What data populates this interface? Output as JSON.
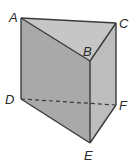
{
  "diagram": {
    "type": "triangular-prism",
    "colors": {
      "front_face": "#a9a9a9",
      "right_face": "#b9b9b9",
      "top_face": "#c4c4c4",
      "edge": "#3a3a3a",
      "hidden_edge": "#3a3a3a"
    },
    "vertices": {
      "A": {
        "label": "A",
        "x": 21,
        "y": 18
      },
      "B": {
        "label": "B",
        "x": 90,
        "y": 61
      },
      "C": {
        "label": "C",
        "x": 116,
        "y": 23
      },
      "D": {
        "label": "D",
        "x": 21,
        "y": 99
      },
      "E": {
        "label": "E",
        "x": 90,
        "y": 143
      },
      "F": {
        "label": "F",
        "x": 116,
        "y": 105
      }
    },
    "hidden_edges": [
      "DF"
    ]
  }
}
